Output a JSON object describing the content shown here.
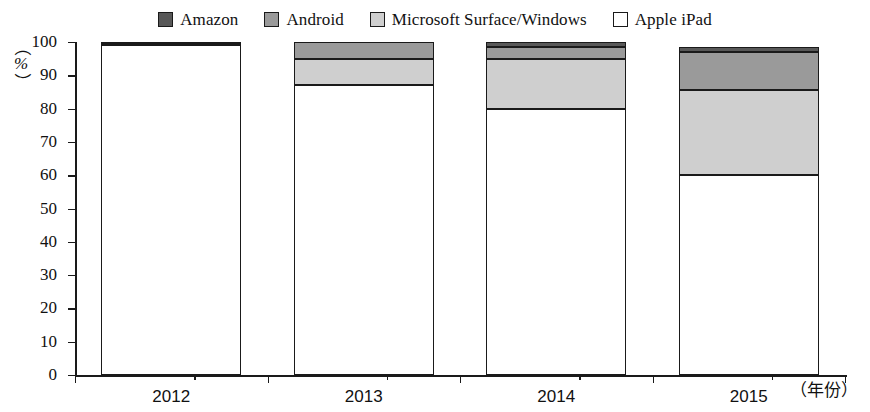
{
  "chart_data": {
    "type": "bar",
    "stacked": true,
    "title": "",
    "subtitle": "",
    "xlabel": "（年份）",
    "ylabel": "（%）",
    "categories": [
      "2012",
      "2013",
      "2014",
      "2015"
    ],
    "ylim": [
      0,
      100
    ],
    "y_ticks": [
      "0",
      "10",
      "20",
      "30",
      "40",
      "50",
      "60",
      "70",
      "80",
      "90",
      "100"
    ],
    "grid": false,
    "legend_position": "top-center",
    "series": [
      {
        "name": "Apple iPad",
        "color": "#ffffff",
        "values": [
          99,
          87,
          80,
          60
        ]
      },
      {
        "name": "Microsoft Surface/Windows",
        "color": "#cfcfcf",
        "values": [
          0.5,
          8,
          15,
          25.5
        ]
      },
      {
        "name": "Android",
        "color": "#9a9a9a",
        "values": [
          0.5,
          5,
          3.5,
          11.5
        ]
      },
      {
        "name": "Amazon",
        "color": "#585858",
        "values": [
          0,
          0,
          1.5,
          1.5
        ]
      }
    ]
  },
  "legend": {
    "items": [
      {
        "label": "Amazon",
        "color": "#585858"
      },
      {
        "label": "Android",
        "color": "#9a9a9a"
      },
      {
        "label": "Microsoft Surface/Windows",
        "color": "#cfcfcf"
      },
      {
        "label": "Apple iPad",
        "color": "#ffffff"
      }
    ]
  },
  "axes": {
    "y_unit_paren_open": "（",
    "y_unit_symbol": "%",
    "y_unit_paren_close": "）",
    "x_unit_label": "（年份）"
  }
}
